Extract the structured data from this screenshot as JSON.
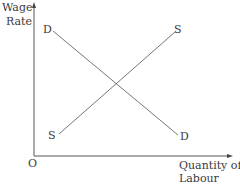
{
  "diagram": {
    "y_axis_label_line1": "Wage",
    "y_axis_label_line2": "Rate",
    "x_axis_label_line1": "Quantity of",
    "x_axis_label_line2": "Labour",
    "origin_label": "O",
    "demand_curve": {
      "label_start": "D",
      "label_end": "D"
    },
    "supply_curve": {
      "label_start": "S",
      "label_end": "S"
    },
    "colors": {
      "line": "#555555",
      "text": "#3a3a3a",
      "background": "#ffffff"
    }
  }
}
